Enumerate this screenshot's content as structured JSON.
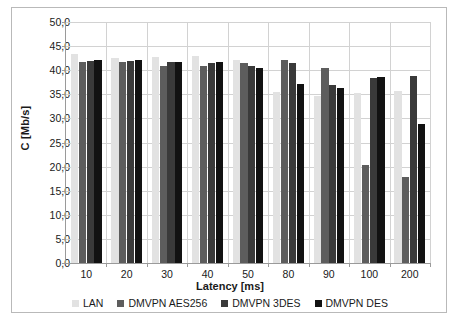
{
  "chart_data": {
    "type": "bar",
    "title": "",
    "xlabel": "Latency [ms]",
    "ylabel": "C [Mb/s]",
    "categories": [
      "10",
      "20",
      "30",
      "40",
      "50",
      "80",
      "90",
      "100",
      "200"
    ],
    "ylim": [
      0,
      50
    ],
    "ytick_labels": [
      "0,0",
      "5,0",
      "10,0",
      "15,0",
      "20,0",
      "25,0",
      "30,0",
      "35,0",
      "40,0",
      "45,0",
      "50,0"
    ],
    "ytick_values": [
      0,
      5,
      10,
      15,
      20,
      25,
      30,
      35,
      40,
      45,
      50
    ],
    "grid": true,
    "legend_position": "bottom",
    "series": [
      {
        "name": "LAN",
        "color": "#e2e2e2",
        "values": [
          43.4,
          42.6,
          42.8,
          42.9,
          42.2,
          35.5,
          34.6,
          35.3,
          35.7
        ]
      },
      {
        "name": "DMVPN AES256",
        "color": "#5d5d5d",
        "values": [
          41.8,
          41.8,
          40.9,
          40.9,
          41.6,
          42.2,
          40.5,
          20.3,
          17.8
        ]
      },
      {
        "name": "DMVPN 3DES",
        "color": "#3a3a3a",
        "values": [
          42.0,
          42.0,
          41.8,
          41.6,
          40.8,
          41.5,
          37.0,
          38.4,
          38.8
        ]
      },
      {
        "name": "DMVPN DES",
        "color": "#121212",
        "values": [
          42.2,
          42.1,
          41.8,
          41.7,
          40.5,
          37.2,
          36.4,
          38.5,
          28.8
        ]
      }
    ]
  }
}
